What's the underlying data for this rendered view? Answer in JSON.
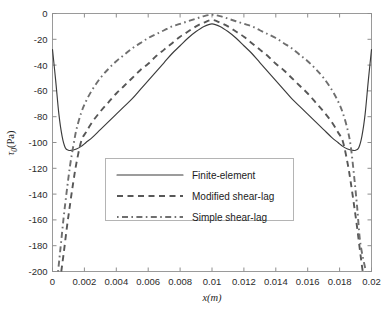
{
  "chart_data": {
    "type": "line",
    "title": "",
    "xlabel": "x(m)",
    "ylabel": "τ₀(Pa)",
    "ylabel_base": "τ",
    "ylabel_sub": "0",
    "ylabel_unit": "(Pa)",
    "xlim": [
      0,
      0.02
    ],
    "ylim": [
      -200,
      0
    ],
    "grid": false,
    "legend_position": "center",
    "xticks": [
      "0",
      "0.002",
      "0.004",
      "0.006",
      "0.008",
      "0.01",
      "0.012",
      "0.014",
      "0.016",
      "0.018",
      "0.02"
    ],
    "xtick_values": [
      0,
      0.002,
      0.004,
      0.006,
      0.008,
      0.01,
      0.012,
      0.014,
      0.016,
      0.018,
      0.02
    ],
    "yticks": [
      "0",
      "-20",
      "-40",
      "-60",
      "-80",
      "-100",
      "-120",
      "-140",
      "-160",
      "-180",
      "-200"
    ],
    "ytick_values": [
      0,
      -20,
      -40,
      -60,
      -80,
      -100,
      -120,
      -140,
      -160,
      -180,
      -200
    ],
    "series": [
      {
        "name": "Finite-element",
        "style": "solid",
        "color": "#3b3b3b",
        "x": [
          0.0,
          0.0002,
          0.0004,
          0.0006,
          0.0008,
          0.001,
          0.0012,
          0.0015,
          0.0018,
          0.0021,
          0.0025,
          0.003,
          0.0035,
          0.004,
          0.0045,
          0.005,
          0.0055,
          0.006,
          0.0065,
          0.007,
          0.0075,
          0.008,
          0.0085,
          0.009,
          0.0095,
          0.01,
          0.0105,
          0.011,
          0.0115,
          0.012,
          0.0125,
          0.013,
          0.0135,
          0.014,
          0.0145,
          0.015,
          0.0155,
          0.016,
          0.0165,
          0.017,
          0.0175,
          0.0179,
          0.0182,
          0.0185,
          0.0188,
          0.019,
          0.0192,
          0.0194,
          0.0196,
          0.0198,
          0.02
        ],
        "y": [
          -28,
          -52,
          -78,
          -95,
          -104,
          -106,
          -106,
          -105,
          -103,
          -100,
          -96,
          -90,
          -84,
          -78,
          -72,
          -66,
          -59,
          -52,
          -45,
          -38,
          -31,
          -25,
          -19,
          -14,
          -10,
          -8,
          -10,
          -14,
          -19,
          -25,
          -31,
          -38,
          -45,
          -52,
          -59,
          -66,
          -72,
          -78,
          -84,
          -90,
          -96,
          -100,
          -103,
          -105,
          -106,
          -106,
          -104,
          -95,
          -78,
          -52,
          -28
        ]
      },
      {
        "name": "Modified shear-lag",
        "style": "dashed",
        "color": "#575757",
        "x": [
          0.00055,
          0.0007,
          0.0009,
          0.0011,
          0.0013,
          0.0015,
          0.0018,
          0.0021,
          0.0025,
          0.003,
          0.0035,
          0.004,
          0.0045,
          0.005,
          0.0055,
          0.006,
          0.0065,
          0.007,
          0.0075,
          0.008,
          0.0085,
          0.009,
          0.0095,
          0.01,
          0.0105,
          0.011,
          0.0115,
          0.012,
          0.0125,
          0.013,
          0.0135,
          0.014,
          0.0145,
          0.015,
          0.0155,
          0.016,
          0.0165,
          0.017,
          0.0175,
          0.0179,
          0.0182,
          0.0185,
          0.0187,
          0.0189,
          0.0191,
          0.0193,
          0.01945
        ],
        "y": [
          -200,
          -186,
          -166,
          -148,
          -131,
          -116,
          -99,
          -92,
          -84,
          -76,
          -69,
          -62,
          -56,
          -50,
          -44,
          -39,
          -33,
          -28,
          -23,
          -18,
          -14,
          -10,
          -7,
          -5,
          -7,
          -10,
          -14,
          -18,
          -23,
          -28,
          -33,
          -39,
          -44,
          -50,
          -56,
          -62,
          -69,
          -76,
          -84,
          -92,
          -99,
          -116,
          -131,
          -148,
          -166,
          -186,
          -200
        ]
      },
      {
        "name": "Simple shear-lag",
        "style": "dashdot",
        "color": "#6f6f6f",
        "x": [
          0.00035,
          0.0005,
          0.0007,
          0.0009,
          0.0011,
          0.0013,
          0.0015,
          0.0018,
          0.0021,
          0.0025,
          0.003,
          0.0035,
          0.004,
          0.0045,
          0.005,
          0.0055,
          0.006,
          0.0065,
          0.007,
          0.0075,
          0.008,
          0.0085,
          0.009,
          0.0095,
          0.01,
          0.0105,
          0.011,
          0.0115,
          0.012,
          0.0125,
          0.013,
          0.0135,
          0.014,
          0.0145,
          0.015,
          0.0155,
          0.016,
          0.0165,
          0.017,
          0.0175,
          0.0179,
          0.0182,
          0.0185,
          0.0187,
          0.0189,
          0.0191,
          0.0193,
          0.01965
        ],
        "y": [
          -200,
          -182,
          -158,
          -137,
          -118,
          -103,
          -90,
          -77,
          -68,
          -59,
          -50,
          -43,
          -37,
          -32,
          -27,
          -23,
          -19,
          -16,
          -13,
          -10,
          -8,
          -6,
          -4,
          -2,
          -1,
          -2,
          -4,
          -6,
          -8,
          -10,
          -13,
          -16,
          -19,
          -23,
          -27,
          -32,
          -37,
          -43,
          -50,
          -59,
          -68,
          -77,
          -90,
          -103,
          -125,
          -150,
          -178,
          -200
        ]
      }
    ]
  },
  "legend": {
    "items": [
      {
        "label": "Finite-element",
        "style": "solid"
      },
      {
        "label": "Modified shear-lag",
        "style": "dashed"
      },
      {
        "label": "Simple shear-lag",
        "style": "dashdot"
      }
    ]
  },
  "colors": {
    "background": "#ffffff",
    "axis": "#9a9a9a",
    "solid_series": "#3b3b3b",
    "dashed_series": "#575757",
    "dashdot_series": "#6f6f6f",
    "text": "#1a1a1a"
  }
}
